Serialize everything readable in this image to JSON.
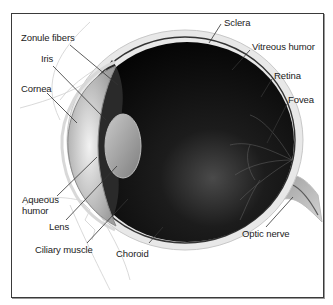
{
  "diagram": {
    "labels": [
      {
        "id": "zonule-fibers",
        "text": "Zonule fibers",
        "x": 21,
        "y": 37
      },
      {
        "id": "iris",
        "text": "Iris",
        "x": 41,
        "y": 58
      },
      {
        "id": "cornea",
        "text": "Cornea",
        "x": 21,
        "y": 82
      },
      {
        "id": "sclera",
        "text": "Sclera",
        "x": 223,
        "y": 19
      },
      {
        "id": "vitreous-humor",
        "text": "Vitreous humor",
        "x": 252,
        "y": 45
      },
      {
        "id": "retina",
        "text": "Retina",
        "x": 274,
        "y": 73
      },
      {
        "id": "fovea",
        "text": "Fovea",
        "x": 288,
        "y": 97
      },
      {
        "id": "aqueous-humor",
        "text": "Aqueous\nhumor",
        "x": 22,
        "y": 196
      },
      {
        "id": "lens",
        "text": "Lens",
        "x": 48,
        "y": 220
      },
      {
        "id": "ciliary-muscle",
        "text": "Ciliary muscle",
        "x": 35,
        "y": 244
      },
      {
        "id": "choroid",
        "text": "Choroid",
        "x": 115,
        "y": 249
      },
      {
        "id": "optic-nerve",
        "text": "Optic nerve",
        "x": 242,
        "y": 229
      }
    ]
  },
  "colors": {
    "frame": "#3a3a3a",
    "eyeball_dark": "#0d0d0d",
    "sclera": "#e6e6e6",
    "cornea": "#cfcfcf",
    "lens": "#a9a9a9",
    "leader_line": "#333333",
    "text": "#222222"
  }
}
